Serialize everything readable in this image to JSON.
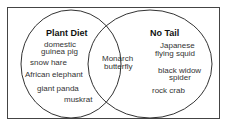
{
  "diagram": {
    "type": "venn",
    "sets": [
      {
        "title": "Plant Diet",
        "only_items": [
          "domestic guinea pig",
          "snow hare",
          "African elephant",
          "giant panda",
          "muskrat"
        ]
      },
      {
        "title": "No Tail",
        "only_items": [
          "Japanese flying squid",
          "black widow spider",
          "rock crab"
        ]
      }
    ],
    "intersection": [
      "Monarch butterfly"
    ]
  },
  "labels": {
    "left_title": "Plant Diet",
    "right_title": "No Tail",
    "guinea1": "domestic",
    "guinea2": "guinea pig",
    "hare": "snow hare",
    "elephant": "African elephant",
    "panda": "giant panda",
    "muskrat": "muskrat",
    "monarch1": "Monarch",
    "monarch2": "butterfly",
    "squid1": "Japanese",
    "squid2": "flying squid",
    "spider1": "black widow",
    "spider2": "spider",
    "crab": "rock crab"
  }
}
